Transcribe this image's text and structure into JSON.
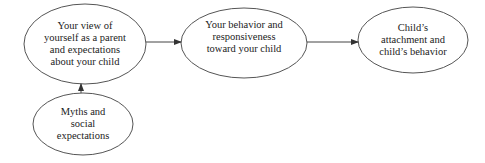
{
  "diagram": {
    "type": "flow",
    "nodes": [
      {
        "id": "self_view",
        "lines": [
          "Your view of",
          "yourself as a parent",
          "and expectations",
          "about your child"
        ]
      },
      {
        "id": "behavior",
        "lines": [
          "Your behavior and",
          "responsiveness",
          "toward your child"
        ]
      },
      {
        "id": "child",
        "lines": [
          "Child’s",
          "attachment and",
          "child’s behavior"
        ]
      },
      {
        "id": "myths",
        "lines": [
          "Myths and",
          "social",
          "expectations"
        ]
      }
    ],
    "edges": [
      {
        "from": "myths",
        "to": "self_view"
      },
      {
        "from": "self_view",
        "to": "behavior"
      },
      {
        "from": "behavior",
        "to": "child"
      }
    ],
    "colors": {
      "stroke": "#444444",
      "text": "#222222",
      "background": "#ffffff"
    }
  }
}
